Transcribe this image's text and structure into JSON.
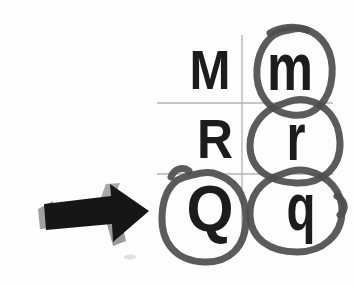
{
  "canvas": {
    "width": 355,
    "height": 285,
    "background": "#fdfdfd"
  },
  "colors": {
    "letter": "#1c1c1c",
    "grid_line": "#b3b3b3",
    "circle_mark": "#4d4d4d",
    "arrow_body": "#161616",
    "arrow_accent": "#a0a0a0"
  },
  "letter_grid": {
    "columns": [
      "uppercase",
      "lowercase"
    ],
    "rows": [
      {
        "uppercase": "M",
        "lowercase": "m",
        "uppercase_circled": false,
        "lowercase_circled": true
      },
      {
        "uppercase": "R",
        "lowercase": "r",
        "uppercase_circled": false,
        "lowercase_circled": true
      },
      {
        "uppercase": "Q",
        "lowercase": "q",
        "uppercase_circled": true,
        "lowercase_circled": true
      }
    ]
  },
  "annotations": {
    "circled_letters": [
      "m",
      "r",
      "Q",
      "q"
    ],
    "arrow_icon": "right-arrow-icon",
    "arrow_direction": "right"
  }
}
